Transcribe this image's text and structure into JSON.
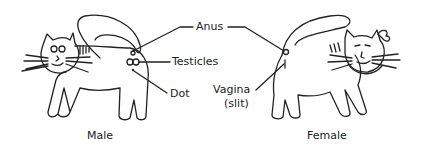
{
  "diagram": {
    "labels": {
      "anus": "Anus",
      "testicles": "Testicles",
      "dot": "Dot",
      "vagina": "Vagina",
      "vagina_note": "(slit)"
    },
    "captions": {
      "male": "Male",
      "female": "Female"
    }
  }
}
